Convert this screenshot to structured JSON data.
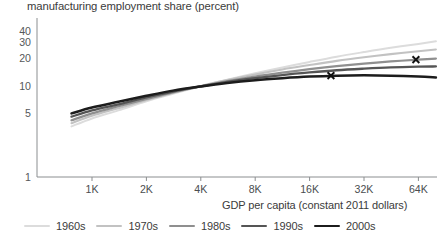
{
  "chart_data": {
    "type": "line",
    "title": "manufacturing employment share (percent)",
    "xlabel": "GDP per capita (constant 2011 dollars)",
    "ylabel": "manufacturing employment share (percent)",
    "xscale": "log",
    "yscale": "log",
    "xlim": [
      700,
      80000
    ],
    "ylim": [
      1,
      45
    ],
    "grid": false,
    "legend_position": "bottom",
    "xticks": [
      1000,
      2000,
      4000,
      8000,
      16000,
      32000,
      64000
    ],
    "xticklabels": [
      "1K",
      "2K",
      "4K",
      "8K",
      "16K",
      "32K",
      "64K"
    ],
    "yticks": [
      1,
      5,
      10,
      20,
      30,
      40
    ],
    "yticklabels": [
      "1",
      "5",
      "10",
      "20",
      "30",
      "40"
    ],
    "series": [
      {
        "name": "1960s",
        "color": "#dcdcdc",
        "width": 2.0,
        "x": [
          770,
          1000,
          1400,
          2000,
          2800,
          4000,
          5600,
          8000,
          11300,
          16000,
          22600,
          32000,
          45000,
          64000,
          80000
        ],
        "y": [
          3.6,
          4.4,
          5.4,
          6.8,
          8.2,
          9.9,
          11.7,
          13.8,
          16.0,
          18.4,
          21.0,
          23.6,
          26.3,
          29.0,
          31.0
        ]
      },
      {
        "name": "1970s",
        "color": "#c2c2c2",
        "width": 2.1,
        "x": [
          770,
          1000,
          1400,
          2000,
          2800,
          4000,
          5600,
          8000,
          11300,
          16000,
          22600,
          32000,
          45000,
          64000,
          80000
        ],
        "y": [
          3.9,
          4.7,
          5.7,
          7.0,
          8.4,
          10.0,
          11.6,
          13.4,
          15.2,
          17.0,
          18.9,
          20.7,
          22.4,
          24.1,
          25.2
        ]
      },
      {
        "name": "1980s",
        "color": "#8f8f8f",
        "width": 2.2,
        "x": [
          770,
          1000,
          1400,
          2000,
          2800,
          4000,
          5600,
          8000,
          11300,
          16000,
          22600,
          32000,
          45000,
          64000,
          80000
        ],
        "y": [
          4.2,
          5.0,
          6.0,
          7.2,
          8.5,
          9.9,
          11.3,
          12.7,
          14.0,
          15.3,
          16.5,
          17.6,
          18.6,
          19.5,
          20.0
        ]
      },
      {
        "name": "1990s",
        "color": "#555555",
        "width": 2.3,
        "x": [
          770,
          1000,
          1400,
          2000,
          2800,
          4000,
          5600,
          8000,
          11300,
          16000,
          22600,
          32000,
          45000,
          64000,
          80000
        ],
        "y": [
          4.6,
          5.4,
          6.3,
          7.5,
          8.7,
          9.9,
          11.1,
          12.2,
          13.2,
          14.1,
          14.9,
          15.5,
          16.0,
          16.3,
          16.4
        ]
      },
      {
        "name": "2000s",
        "color": "#1c1c1c",
        "width": 2.5,
        "x": [
          770,
          1000,
          1400,
          2000,
          2800,
          4000,
          5600,
          8000,
          11300,
          16000,
          22600,
          32000,
          45000,
          64000,
          80000
        ],
        "y": [
          5.0,
          5.8,
          6.7,
          7.8,
          8.9,
          9.9,
          10.8,
          11.6,
          12.2,
          12.7,
          13.0,
          13.1,
          13.0,
          12.7,
          12.4
        ]
      }
    ],
    "markers": [
      {
        "label": "x-marker-2000s",
        "series": "2000s",
        "x": 21000,
        "y": 13.0
      },
      {
        "label": "x-marker-1980s",
        "series": "1980s",
        "x": 62000,
        "y": 19.5
      }
    ]
  },
  "legend": {
    "items": [
      {
        "label": "1960s"
      },
      {
        "label": "1970s"
      },
      {
        "label": "1980s"
      },
      {
        "label": "1990s"
      },
      {
        "label": "2000s"
      }
    ]
  }
}
